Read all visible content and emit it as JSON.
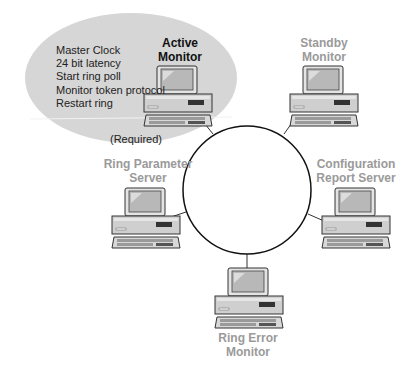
{
  "diagram": {
    "type": "token-ring-monitor-roles",
    "colors": {
      "highlight_ellipse": "#d6d6d6",
      "ring_stroke": "#111111",
      "active_label": "#111111",
      "passive_label": "#9a9a9a",
      "computer_body": "#cfcfcf",
      "computer_screen": "#b8b8b8"
    },
    "active_monitor": {
      "title_line1": "Active",
      "title_line2": "Monitor",
      "functions": [
        "Master Clock",
        "24 bit latency",
        "Start ring poll",
        "Monitor token protocol",
        "Restart ring"
      ],
      "note": "(Required)"
    },
    "nodes": [
      {
        "id": "standby-monitor",
        "line1": "Standby",
        "line2": "Monitor"
      },
      {
        "id": "ring-parameter-server",
        "line1": "Ring Parameter",
        "line2": "Server"
      },
      {
        "id": "configuration-report-server",
        "line1": "Configuration",
        "line2": "Report Server"
      },
      {
        "id": "ring-error-monitor",
        "line1": "Ring Error",
        "line2": "Monitor"
      }
    ]
  }
}
